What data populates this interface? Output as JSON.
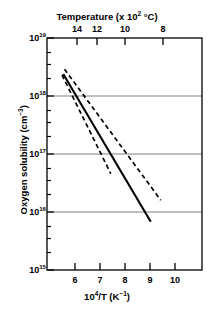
{
  "chart_data": {
    "type": "line",
    "title": "",
    "xlabel": "10^4/T (K^-1)",
    "ylabel": "Oxygen solubility (cm^-3)",
    "xlabel_top": "Temperature (x 10^2 °C)",
    "xlim": [
      5.2,
      11.4
    ],
    "ylim": [
      1000000000000000.0,
      1e+19
    ],
    "yscale": "log",
    "grid": "horizontal gridlines at 1e16, 1e17, 1e18",
    "legend": "none",
    "x_ticks": [
      6,
      7,
      8,
      9,
      10
    ],
    "x_tick_labels": [
      "6",
      "7",
      "8",
      "9",
      "10"
    ],
    "y_ticks": [
      1000000000000000.0,
      1e+16,
      1e+17,
      1e+18,
      1e+19
    ],
    "y_tick_labels": [
      "10^15",
      "10^16",
      "10^17",
      "10^18",
      "10^19"
    ],
    "top_ticks": [
      14,
      12,
      10,
      8
    ],
    "top_tick_labels": [
      "14",
      "12",
      "10",
      "8"
    ],
    "series": [
      {
        "name": "best fit",
        "style": "solid",
        "color": "#000000",
        "x": [
          5.85,
          9.35
        ],
        "y": [
          2.4e+18,
          6800000000000000.0
        ]
      },
      {
        "name": "upper bound",
        "style": "dashed",
        "color": "#000000",
        "x": [
          5.9,
          9.75
        ],
        "y": [
          2.9e+18,
          1.6e+16
        ]
      },
      {
        "name": "lower bound",
        "style": "dashed",
        "color": "#000000",
        "x": [
          5.8,
          7.75
        ],
        "y": [
          2.3e+18,
          4.6e+16
        ]
      }
    ]
  },
  "axes": {
    "top_title": "Temperature (x 10",
    "top_title_exp": "2",
    "top_title_tail": " °C)",
    "bottom_title_head": "10",
    "bottom_title_exp": "4",
    "bottom_title_mid": "/T (K",
    "bottom_title_exp2": "−1",
    "bottom_title_tail": ")",
    "y_title_head": "Oxygen solubility (cm",
    "y_title_exp": "−3",
    "y_title_tail": ")",
    "y_labels": [
      {
        "mantissa": "10",
        "exp": "19"
      },
      {
        "mantissa": "10",
        "exp": "18"
      },
      {
        "mantissa": "10",
        "exp": "17"
      },
      {
        "mantissa": "10",
        "exp": "16"
      },
      {
        "mantissa": "10",
        "exp": "15"
      }
    ],
    "x_labels": [
      "6",
      "7",
      "8",
      "9",
      "10"
    ],
    "top_labels": [
      "14",
      "12",
      "10",
      "8"
    ]
  },
  "colors": {
    "axis": "#000000",
    "grid": "#808080",
    "data": "#000000",
    "background": "#ffffff"
  }
}
